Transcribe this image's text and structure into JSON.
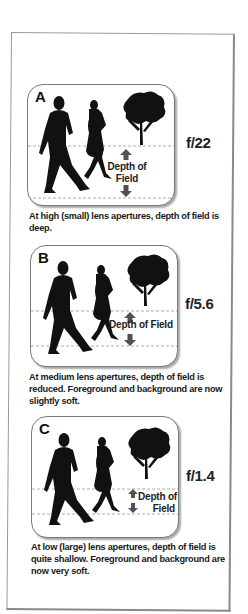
{
  "figure": {
    "panels": [
      {
        "letter": "A",
        "aperture": "f/22",
        "dof_label_line1": "Depth of",
        "dof_label_line2": "Field",
        "caption": "At high (small) lens apertures, depth of field is deep."
      },
      {
        "letter": "B",
        "aperture": "f/5.6",
        "dof_label_line1": "Depth of Field",
        "dof_label_line2": "",
        "caption": "At medium lens apertures, depth of field is reduced. Foreground and background are now slightly soft."
      },
      {
        "letter": "C",
        "aperture": "f/1.4",
        "dof_label_line1": "Depth of",
        "dof_label_line2": "Field",
        "caption": "At low (large) lens apertures, depth of field is quite shallow. Foreground and background are now very soft."
      }
    ],
    "colors": {
      "silhouette": "#111111",
      "arrow": "#555050",
      "dashed_line": "#9a9a9a",
      "frame_border": "#9a9a9a"
    },
    "icons": {
      "man": "walking-man-silhouette",
      "woman": "walking-woman-silhouette",
      "tree": "tree-silhouette",
      "arrow_up": "arrow-up-icon",
      "arrow_down": "arrow-down-icon"
    }
  }
}
